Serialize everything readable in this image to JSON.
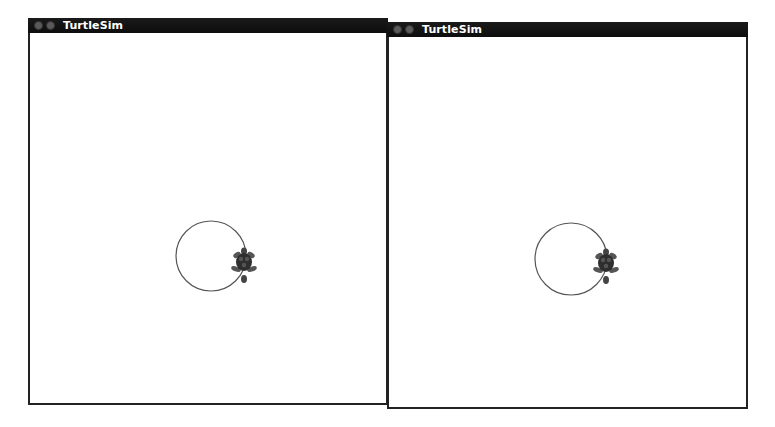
{
  "windows": [
    {
      "title": "TurtleSim",
      "buttons": [
        "close",
        "minimize"
      ],
      "background": "#ffffff",
      "path": {
        "type": "circle",
        "cx": 179,
        "cy": 238,
        "r": 35,
        "color": "#555555"
      },
      "turtle": {
        "x": 214,
        "y": 244,
        "icon": "turtle-icon"
      }
    },
    {
      "title": "TurtleSim",
      "buttons": [
        "close",
        "minimize"
      ],
      "background": "#ffffff",
      "path": {
        "type": "circle",
        "cx": 180,
        "cy": 236,
        "r": 35,
        "color": "#555555"
      },
      "turtle": {
        "x": 215,
        "y": 240,
        "icon": "turtle-icon"
      }
    }
  ]
}
